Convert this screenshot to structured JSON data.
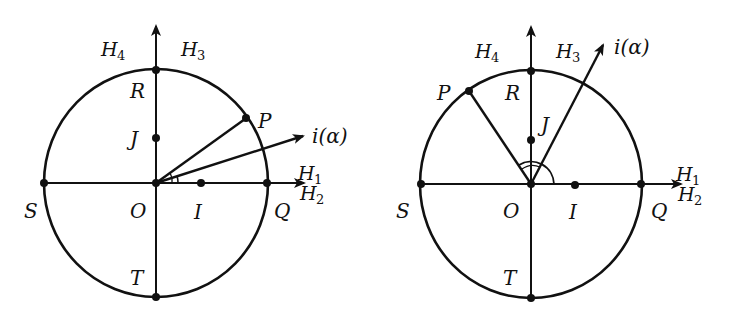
{
  "figures": [
    {
      "id": "left",
      "points": {
        "O": "O",
        "R": "R",
        "T": "T",
        "S": "S",
        "Q": "Q",
        "P": "P",
        "J": "J",
        "I": "I"
      },
      "vector_label": "i(α)",
      "regions": {
        "H1": {
          "base": "H",
          "sub": "1"
        },
        "H2": {
          "base": "H",
          "sub": "2"
        },
        "H3": {
          "base": "H",
          "sub": "3"
        },
        "H4": {
          "base": "H",
          "sub": "4"
        }
      },
      "description": "Circle centered O with P in first quadrant; vector i(α) at small angle below OP"
    },
    {
      "id": "right",
      "points": {
        "O": "O",
        "R": "R",
        "T": "T",
        "S": "S",
        "Q": "Q",
        "P": "P",
        "J": "J",
        "I": "I"
      },
      "vector_label": "i(α)",
      "regions": {
        "H1": {
          "base": "H",
          "sub": "1"
        },
        "H2": {
          "base": "H",
          "sub": "2"
        },
        "H3": {
          "base": "H",
          "sub": "3"
        },
        "H4": {
          "base": "H",
          "sub": "4"
        }
      },
      "description": "Circle centered O with P in second quadrant; vector i(α) in first quadrant; obtuse angle arc at O"
    }
  ]
}
